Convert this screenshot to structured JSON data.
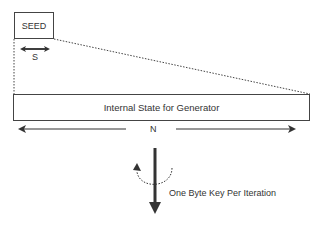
{
  "diagram": {
    "seed_box": {
      "label": "SEED"
    },
    "seed_size_label": "S",
    "state_box": {
      "label": "Internal State for Generator"
    },
    "state_size_label": "N",
    "output_label": "One Byte Key Per Iteration",
    "colors": {
      "stroke": "#333333",
      "background": "#ffffff"
    }
  }
}
